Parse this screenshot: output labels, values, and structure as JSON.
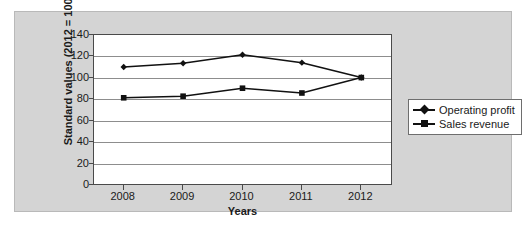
{
  "chart_data": {
    "type": "line",
    "title": "",
    "xlabel": "Years",
    "ylabel": "Standard values (2012 = 100)",
    "categories": [
      "2008",
      "2009",
      "2010",
      "2011",
      "2012"
    ],
    "x": [
      2008,
      2009,
      2010,
      2011,
      2012
    ],
    "ylim": [
      0,
      140
    ],
    "yticks": [
      0,
      20,
      40,
      60,
      80,
      100,
      120,
      140
    ],
    "grid": true,
    "legend_position": "right",
    "series": [
      {
        "name": "Operating profit",
        "marker": "diamond",
        "color": "#111111",
        "values": [
          110,
          113.5,
          121.5,
          114,
          100
        ]
      },
      {
        "name": "Sales revenue",
        "marker": "square",
        "color": "#111111",
        "values": [
          81,
          82.5,
          90,
          85.5,
          100
        ]
      }
    ]
  },
  "axes": {
    "y_title": "Standard values (2012 = 100)",
    "x_title": "Years",
    "y_tick_labels": [
      "140",
      "120",
      "100",
      "80",
      "60",
      "40",
      "20",
      "0"
    ],
    "x_tick_labels": [
      "2008",
      "2009",
      "2010",
      "2011",
      "2012"
    ]
  },
  "legend": {
    "entries": [
      {
        "label": "Operating profit",
        "marker": "diamond"
      },
      {
        "label": "Sales revenue",
        "marker": "square"
      }
    ]
  },
  "colors": {
    "panel_background": "#d4d4d4",
    "plot_background": "#ffffff",
    "gridline": "#8d8d8d",
    "axis": "#4a4a4a",
    "series": "#111111",
    "text": "#1a1a1a"
  }
}
